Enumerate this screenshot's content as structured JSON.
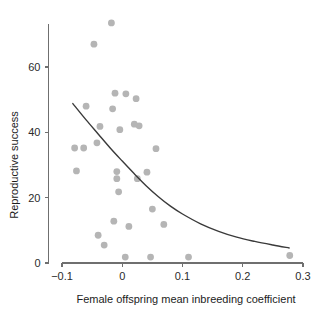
{
  "chart_data": {
    "type": "scatter",
    "title": "",
    "xlabel": "Female offspring mean inbreeding coefficient",
    "ylabel": "Reproductive success",
    "xlim": [
      -0.105,
      0.305
    ],
    "ylim": [
      0,
      74
    ],
    "xticks": [
      -0.1,
      0,
      0.1,
      0.2,
      0.3
    ],
    "xticklabels": [
      "−0.1",
      "0",
      "0.1",
      "0.2",
      "0.3"
    ],
    "yticks": [
      0,
      20,
      40,
      60
    ],
    "yticklabels": [
      "0",
      "20",
      "40",
      "60"
    ],
    "grid": false,
    "legend": false,
    "point_color": "#b5b5b5",
    "curve_color": "#3a3a3a",
    "points": [
      {
        "x": -0.018,
        "y": 73.5
      },
      {
        "x": -0.047,
        "y": 67.0
      },
      {
        "x": -0.012,
        "y": 52.0
      },
      {
        "x": 0.006,
        "y": 51.8
      },
      {
        "x": 0.023,
        "y": 50.3
      },
      {
        "x": -0.06,
        "y": 48.0
      },
      {
        "x": -0.016,
        "y": 47.2
      },
      {
        "x": -0.037,
        "y": 41.8
      },
      {
        "x": 0.028,
        "y": 42.0
      },
      {
        "x": 0.02,
        "y": 42.5
      },
      {
        "x": -0.004,
        "y": 40.8
      },
      {
        "x": -0.042,
        "y": 36.8
      },
      {
        "x": -0.079,
        "y": 35.2
      },
      {
        "x": -0.064,
        "y": 35.2
      },
      {
        "x": 0.056,
        "y": 35.0
      },
      {
        "x": -0.076,
        "y": 28.2
      },
      {
        "x": -0.009,
        "y": 28.0
      },
      {
        "x": 0.041,
        "y": 27.8
      },
      {
        "x": -0.009,
        "y": 25.8
      },
      {
        "x": 0.025,
        "y": 25.8
      },
      {
        "x": -0.006,
        "y": 21.8
      },
      {
        "x": 0.05,
        "y": 16.5
      },
      {
        "x": -0.014,
        "y": 12.8
      },
      {
        "x": 0.069,
        "y": 11.8
      },
      {
        "x": 0.011,
        "y": 11.2
      },
      {
        "x": -0.04,
        "y": 8.5
      },
      {
        "x": -0.03,
        "y": 5.5
      },
      {
        "x": 0.005,
        "y": 1.8
      },
      {
        "x": 0.047,
        "y": 1.8
      },
      {
        "x": 0.11,
        "y": 1.8
      },
      {
        "x": 0.278,
        "y": 2.3
      }
    ],
    "fit_curve": {
      "description": "exponential decline fitted line",
      "x_start": -0.082,
      "x_end": 0.277,
      "y_start": 48.8,
      "y_end": 4.6,
      "points": [
        {
          "x": -0.082,
          "y": 48.8
        },
        {
          "x": -0.06,
          "y": 43.8
        },
        {
          "x": -0.04,
          "y": 39.5
        },
        {
          "x": -0.02,
          "y": 35.2
        },
        {
          "x": 0.0,
          "y": 31.2
        },
        {
          "x": 0.02,
          "y": 27.3
        },
        {
          "x": 0.04,
          "y": 23.6
        },
        {
          "x": 0.06,
          "y": 20.3
        },
        {
          "x": 0.08,
          "y": 17.4
        },
        {
          "x": 0.1,
          "y": 15.0
        },
        {
          "x": 0.13,
          "y": 12.0
        },
        {
          "x": 0.16,
          "y": 9.7
        },
        {
          "x": 0.19,
          "y": 7.9
        },
        {
          "x": 0.22,
          "y": 6.6
        },
        {
          "x": 0.25,
          "y": 5.5
        },
        {
          "x": 0.277,
          "y": 4.6
        }
      ]
    }
  }
}
